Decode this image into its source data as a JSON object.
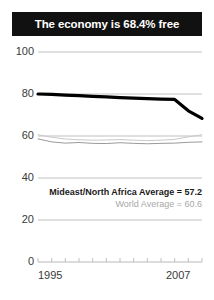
{
  "title": {
    "text": "The economy is 68.4% free"
  },
  "annotations": {
    "mideast_label": "Mideast/North Africa Average = 57.2",
    "world_label": "World Average = 60.6"
  },
  "axis": {
    "x_start_label": "1995",
    "x_end_label": "2007",
    "y_ticks": [
      "100",
      "80",
      "60",
      "40",
      "20",
      "0"
    ]
  },
  "colors": {
    "banner_bg": "#111111",
    "banner_text": "#ffffff",
    "country_line": "#000000",
    "gridline": "#b9b9b9",
    "mideast_line": "#9a9a9a",
    "world_line": "#c9c9c9",
    "axis_text": "#3a3a3a",
    "world_text": "#a8a8a8"
  },
  "chart_data": {
    "type": "line",
    "title": "The economy is 68.4% free",
    "xlabel": "",
    "ylabel": "",
    "xlim": [
      1995,
      2007
    ],
    "ylim": [
      0,
      100
    ],
    "grid": true,
    "legend": "none",
    "x": [
      1995,
      1996,
      1997,
      1998,
      1999,
      2000,
      2001,
      2002,
      2003,
      2004,
      2005,
      2006,
      2007
    ],
    "series": [
      {
        "name": "Economic freedom score",
        "color": "#000000",
        "values": [
          80.0,
          79.8,
          79.5,
          79.2,
          78.9,
          78.6,
          78.3,
          78.0,
          77.8,
          77.6,
          77.4,
          72.0,
          68.4
        ]
      },
      {
        "name": "World Average",
        "color": "#c9c9c9",
        "values": [
          60.6,
          59.4,
          58.6,
          58.2,
          58.0,
          58.1,
          58.3,
          58.0,
          57.8,
          58.0,
          58.4,
          59.6,
          60.6
        ]
      },
      {
        "name": "Mideast/North Africa Average",
        "color": "#9a9a9a",
        "values": [
          58.6,
          57.2,
          56.6,
          56.9,
          56.5,
          56.4,
          56.8,
          56.5,
          56.3,
          56.5,
          56.6,
          57.0,
          57.2
        ]
      }
    ],
    "annotations": [
      {
        "text": "Mideast/North Africa Average = 57.2",
        "value": 57.2
      },
      {
        "text": "World Average = 60.6",
        "value": 60.6
      }
    ]
  }
}
